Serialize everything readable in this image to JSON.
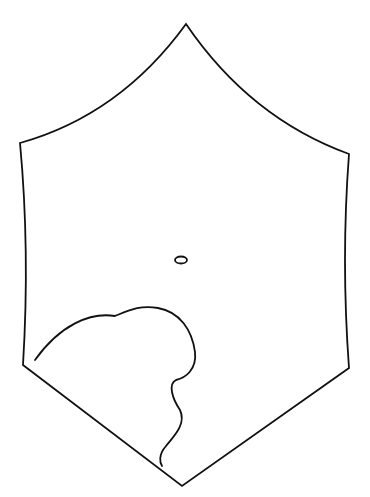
{
  "figure": {
    "width": 370,
    "height": 497,
    "background": "#ffffff",
    "stroke_color": "#111111",
    "shapes": {
      "hexagon_outline": "M186,24 Q120,115 20,143 Q30,250 23,365 L182,486 L349,368 Q341,260 349,154 Q250,118 186,24 Z",
      "small_ellipse": {
        "cx": 181,
        "cy": 260,
        "rx": 6,
        "ry": 3.5
      },
      "inner_curve": "M35,360 C60,325 90,312 115,316 C130,310 140,305 158,308 C180,312 192,330 195,352 C197,370 185,378 176,380 C168,384 172,398 180,410 C187,425 172,438 166,446 C158,455 160,463 162,466"
    }
  }
}
